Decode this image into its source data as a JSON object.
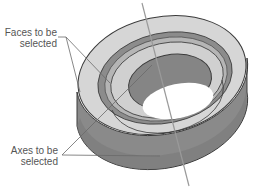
{
  "diagram": {
    "callouts": [
      {
        "id": "faces",
        "lines": [
          "Faces to be",
          "selected"
        ]
      },
      {
        "id": "axes",
        "lines": [
          "Axes to be",
          "selected"
        ]
      }
    ],
    "colors": {
      "face_light": "#d4d4d4",
      "face_mid": "#a9a9a9",
      "face_dark": "#7d7d7d",
      "outline": "#3a3a3a",
      "leader": "#6a6a6a",
      "axis": "#9a9a9a",
      "text": "#555555"
    }
  }
}
